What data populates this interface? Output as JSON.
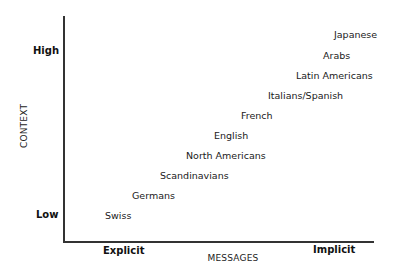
{
  "chart_data": {
    "type": "scatter",
    "title": "",
    "xlabel": "MESSAGES",
    "ylabel": "CONTEXT",
    "x_ticks": [
      "Explicit",
      "Implicit"
    ],
    "y_ticks": [
      "Low",
      "High"
    ],
    "grid": false,
    "points": [
      {
        "label": "Swiss",
        "x": 1,
        "y": 1
      },
      {
        "label": "Germans",
        "x": 2,
        "y": 2
      },
      {
        "label": "Scandinavians",
        "x": 3,
        "y": 3
      },
      {
        "label": "North Americans",
        "x": 4,
        "y": 4
      },
      {
        "label": "English",
        "x": 5,
        "y": 5
      },
      {
        "label": "French",
        "x": 6,
        "y": 6
      },
      {
        "label": "Italians/Spanish",
        "x": 7,
        "y": 7
      },
      {
        "label": "Latin Americans",
        "x": 8,
        "y": 8
      },
      {
        "label": "Arabs",
        "x": 9,
        "y": 9
      },
      {
        "label": "Japanese",
        "x": 10,
        "y": 10
      }
    ],
    "xlim": [
      0,
      10
    ],
    "ylim": [
      0,
      10
    ]
  },
  "axes": {
    "x_title": "MESSAGES",
    "y_title": "CONTEXT",
    "x_low": "Explicit",
    "x_high": "Implicit",
    "y_low": "Low",
    "y_high": "High"
  },
  "labels": [
    {
      "text": "Japanese",
      "left": 334,
      "top": 34
    },
    {
      "text": "Arabs",
      "left": 323,
      "top": 55
    },
    {
      "text": "Latin Americans",
      "left": 296,
      "top": 75
    },
    {
      "text": "Italians/Spanish",
      "left": 268,
      "top": 95
    },
    {
      "text": "French",
      "left": 241,
      "top": 115
    },
    {
      "text": "English",
      "left": 214,
      "top": 135
    },
    {
      "text": "North Americans",
      "left": 186,
      "top": 155
    },
    {
      "text": "Scandinavians",
      "left": 160,
      "top": 175
    },
    {
      "text": "Germans",
      "left": 132,
      "top": 195
    },
    {
      "text": "Swiss",
      "left": 105,
      "top": 215
    }
  ]
}
